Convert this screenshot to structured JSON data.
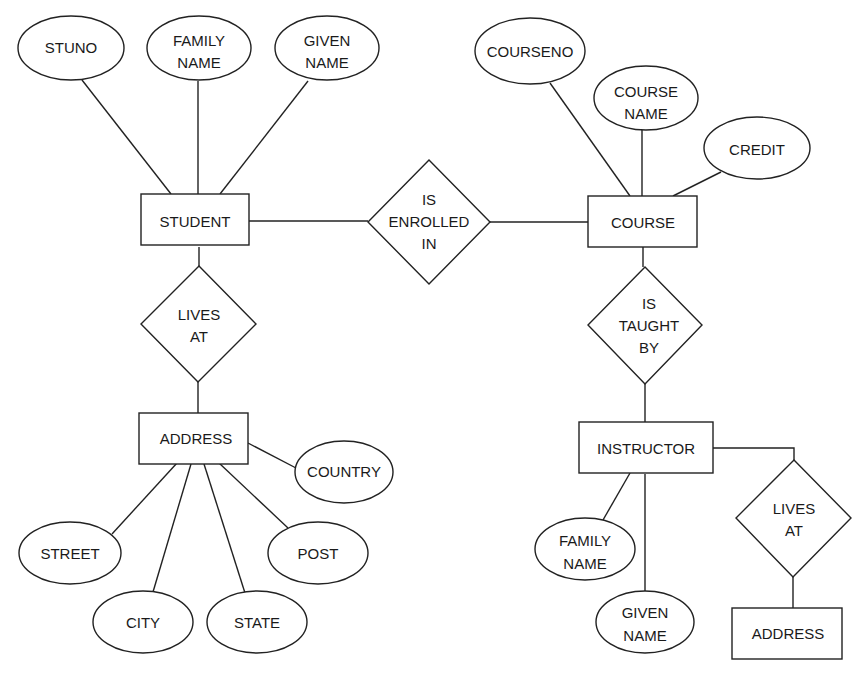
{
  "diagram": {
    "type": "entity-relationship",
    "entities": [
      {
        "id": "student",
        "label": "STUDENT"
      },
      {
        "id": "course",
        "label": "COURSE"
      },
      {
        "id": "address1",
        "label": "ADDRESS"
      },
      {
        "id": "instructor",
        "label": "INSTRUCTOR"
      },
      {
        "id": "address2",
        "label": "ADDRESS"
      }
    ],
    "relationships": [
      {
        "id": "enrolled",
        "lines": [
          "IS",
          "ENROLLED",
          "IN"
        ]
      },
      {
        "id": "lives1",
        "lines": [
          "LIVES",
          "AT"
        ]
      },
      {
        "id": "taught",
        "lines": [
          "IS",
          "TAUGHT",
          "BY"
        ]
      },
      {
        "id": "lives2",
        "lines": [
          "LIVES",
          "AT"
        ]
      }
    ],
    "attributes": [
      {
        "id": "stuno",
        "lines": [
          "STUNO"
        ]
      },
      {
        "id": "stu_family",
        "lines": [
          "FAMILY",
          "NAME"
        ]
      },
      {
        "id": "stu_given",
        "lines": [
          "GIVEN",
          "NAME"
        ]
      },
      {
        "id": "courseno",
        "lines": [
          "COURSENO"
        ]
      },
      {
        "id": "coursename",
        "lines": [
          "COURSE",
          "NAME"
        ]
      },
      {
        "id": "credit",
        "lines": [
          "CREDIT"
        ]
      },
      {
        "id": "country",
        "lines": [
          "COUNTRY"
        ]
      },
      {
        "id": "street",
        "lines": [
          "STREET"
        ]
      },
      {
        "id": "city",
        "lines": [
          "CITY"
        ]
      },
      {
        "id": "state",
        "lines": [
          "STATE"
        ]
      },
      {
        "id": "post",
        "lines": [
          "POST"
        ]
      },
      {
        "id": "ins_family",
        "lines": [
          "FAMILY",
          "NAME"
        ]
      },
      {
        "id": "ins_given",
        "lines": [
          "GIVEN",
          "NAME"
        ]
      }
    ]
  }
}
